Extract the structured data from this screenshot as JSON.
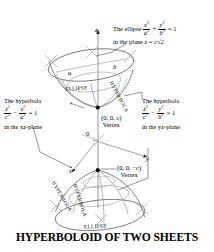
{
  "title": "HYPERBOLOID OF TWO SHEETS",
  "axes": {
    "z_label": "z",
    "y_label": "y",
    "x_label": "x",
    "origin_label": "0"
  },
  "callouts": {
    "ellipse_top": {
      "lead": "The ellipse",
      "eq_num1": "x",
      "eq_den1": "a",
      "eq_plus": "+",
      "eq_num2": "y",
      "eq_den2": "b",
      "eq_equals": "= 1",
      "plane": "in the plane",
      "plane_eq": "z = c√2"
    },
    "hyperbola_left": {
      "lead": "The hyperbola",
      "eq_num1": "z",
      "eq_den1": "c",
      "eq_minus": "−",
      "eq_num2": "x",
      "eq_den2": "a",
      "eq_equals": "= 1",
      "plane": "in the xz-plane"
    },
    "hyperbola_right": {
      "lead": "The hyperbola",
      "eq_num1": "z",
      "eq_den1": "c",
      "eq_minus": "−",
      "eq_num2": "y",
      "eq_den2": "b",
      "eq_equals": "= 1",
      "plane": "in the yz-plane"
    }
  },
  "vertices": {
    "upper_point": "(0, 0, c)",
    "upper_word": "Vertex",
    "lower_point": "(0, 0, −c)",
    "lower_word": "Vertex"
  },
  "semi_axes": {
    "a": "a",
    "b": "b"
  },
  "curve_labels": {
    "ellipse_top": "ELLIPSE",
    "hyperbola_upper_right": "HYPERBOLA",
    "hyperbola_lower_left": "HYPERBOLA",
    "hyperbola_lower_mid": "HYPERBOLA",
    "ellipse_bottom": "ELLIPSE"
  },
  "colors": {
    "ink": "#000000",
    "surface_line": "#7d7d7d",
    "background": "#ffffff"
  },
  "exponents": {
    "two": "2"
  }
}
